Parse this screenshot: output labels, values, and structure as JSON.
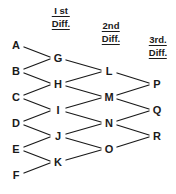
{
  "diagram": {
    "type": "difference-table",
    "title_columns": [
      {
        "id": "col-header-1st",
        "line1": "I st",
        "line2": "Diff.",
        "x": 61,
        "y": 5
      },
      {
        "id": "col-header-2nd",
        "line1": "2nd",
        "line2": "Diff.",
        "x": 111,
        "y": 20
      },
      {
        "id": "col-header-3rd",
        "line1": "3rd.",
        "line2": "Diff.",
        "x": 158,
        "y": 34
      }
    ],
    "columns": [
      {
        "name": "values",
        "nodes": [
          {
            "label": "A",
            "x": 16,
            "y": 45
          },
          {
            "label": "B",
            "x": 16,
            "y": 71
          },
          {
            "label": "C",
            "x": 16,
            "y": 97
          },
          {
            "label": "D",
            "x": 16,
            "y": 123
          },
          {
            "label": "E",
            "x": 16,
            "y": 149
          },
          {
            "label": "F",
            "x": 16,
            "y": 175
          }
        ]
      },
      {
        "name": "first-difference",
        "nodes": [
          {
            "label": "G",
            "x": 58,
            "y": 58
          },
          {
            "label": "H",
            "x": 58,
            "y": 84
          },
          {
            "label": "I",
            "x": 58,
            "y": 110
          },
          {
            "label": "J",
            "x": 58,
            "y": 136
          },
          {
            "label": "K",
            "x": 58,
            "y": 162
          }
        ]
      },
      {
        "name": "second-difference",
        "nodes": [
          {
            "label": "L",
            "x": 109,
            "y": 71
          },
          {
            "label": "M",
            "x": 109,
            "y": 97
          },
          {
            "label": "N",
            "x": 109,
            "y": 123
          },
          {
            "label": "O",
            "x": 109,
            "y": 149
          }
        ]
      },
      {
        "name": "third-difference",
        "nodes": [
          {
            "label": "P",
            "x": 157,
            "y": 84
          },
          {
            "label": "Q",
            "x": 157,
            "y": 110
          },
          {
            "label": "R",
            "x": 157,
            "y": 136
          }
        ]
      }
    ],
    "edges": [
      {
        "from": "A",
        "to": "G",
        "x1": 24,
        "y1": 47,
        "x2": 50,
        "y2": 57
      },
      {
        "from": "B",
        "to": "G",
        "x1": 24,
        "y1": 69,
        "x2": 50,
        "y2": 59
      },
      {
        "from": "B",
        "to": "H",
        "x1": 24,
        "y1": 73,
        "x2": 50,
        "y2": 83
      },
      {
        "from": "C",
        "to": "H",
        "x1": 24,
        "y1": 95,
        "x2": 50,
        "y2": 85
      },
      {
        "from": "C",
        "to": "I",
        "x1": 24,
        "y1": 99,
        "x2": 50,
        "y2": 109
      },
      {
        "from": "D",
        "to": "I",
        "x1": 24,
        "y1": 121,
        "x2": 50,
        "y2": 111
      },
      {
        "from": "D",
        "to": "J",
        "x1": 24,
        "y1": 125,
        "x2": 50,
        "y2": 135
      },
      {
        "from": "E",
        "to": "J",
        "x1": 24,
        "y1": 147,
        "x2": 50,
        "y2": 137
      },
      {
        "from": "E",
        "to": "K",
        "x1": 24,
        "y1": 151,
        "x2": 50,
        "y2": 161
      },
      {
        "from": "F",
        "to": "K",
        "x1": 24,
        "y1": 173,
        "x2": 50,
        "y2": 163
      },
      {
        "from": "G",
        "to": "L",
        "x1": 66,
        "y1": 60,
        "x2": 101,
        "y2": 70
      },
      {
        "from": "H",
        "to": "L",
        "x1": 66,
        "y1": 82,
        "x2": 101,
        "y2": 72
      },
      {
        "from": "H",
        "to": "M",
        "x1": 66,
        "y1": 86,
        "x2": 101,
        "y2": 96
      },
      {
        "from": "I",
        "to": "M",
        "x1": 66,
        "y1": 108,
        "x2": 101,
        "y2": 98
      },
      {
        "from": "I",
        "to": "N",
        "x1": 66,
        "y1": 112,
        "x2": 101,
        "y2": 122
      },
      {
        "from": "J",
        "to": "N",
        "x1": 66,
        "y1": 134,
        "x2": 101,
        "y2": 124
      },
      {
        "from": "J",
        "to": "O",
        "x1": 66,
        "y1": 138,
        "x2": 101,
        "y2": 148
      },
      {
        "from": "K",
        "to": "O",
        "x1": 66,
        "y1": 160,
        "x2": 101,
        "y2": 150
      },
      {
        "from": "L",
        "to": "P",
        "x1": 117,
        "y1": 73,
        "x2": 149,
        "y2": 83
      },
      {
        "from": "M",
        "to": "P",
        "x1": 117,
        "y1": 95,
        "x2": 149,
        "y2": 85
      },
      {
        "from": "M",
        "to": "Q",
        "x1": 117,
        "y1": 99,
        "x2": 149,
        "y2": 109
      },
      {
        "from": "N",
        "to": "Q",
        "x1": 117,
        "y1": 121,
        "x2": 149,
        "y2": 111
      },
      {
        "from": "N",
        "to": "R",
        "x1": 117,
        "y1": 125,
        "x2": 149,
        "y2": 135
      },
      {
        "from": "O",
        "to": "R",
        "x1": 117,
        "y1": 147,
        "x2": 149,
        "y2": 137
      }
    ],
    "style": {
      "line_color": "#1a1a1a",
      "line_width": 1.3,
      "text_color": "#1a1a1a",
      "background": "#ffffff"
    }
  }
}
